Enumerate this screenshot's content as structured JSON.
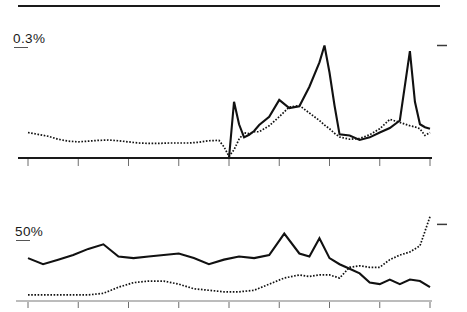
{
  "figure": {
    "title": "",
    "top_rule": true
  },
  "panels": [
    {
      "id": "top",
      "level_label": "0.3%",
      "right_marker": "dash",
      "axis": {
        "x_min": 1905,
        "x_max": 1985,
        "tick_years": [
          1905,
          1915,
          1925,
          1935,
          1945,
          1955,
          1965,
          1975,
          1985
        ],
        "tick_labels": [
          "1905",
          "",
          "1925",
          "",
          "1945",
          "",
          "1965",
          "",
          "1985"
        ],
        "y_min": 0,
        "y_max": 0.36,
        "y_reference": 0.3
      }
    },
    {
      "id": "bottom",
      "level_label": "50%",
      "right_marker": "dash",
      "axis": {
        "x_min": 1905,
        "x_max": 1985,
        "tick_years": [
          1905,
          1915,
          1925,
          1935,
          1945,
          1955,
          1965,
          1975,
          1985
        ],
        "tick_labels": [
          "",
          "",
          "",
          "",
          "",
          "",
          "",
          "",
          ""
        ],
        "y_min": 0,
        "y_max": 62,
        "y_reference": 50
      }
    }
  ],
  "chart_data": [
    {
      "type": "line",
      "title": "",
      "subtitle": "",
      "xlabel": "",
      "ylabel": "",
      "panel": "top",
      "xlim": [
        1905,
        1985
      ],
      "ylim": [
        0,
        0.36
      ],
      "grid": false,
      "legend": "none",
      "annotations": [
        {
          "text": "0.3%",
          "role": "y-reference-level",
          "value": 0.3
        },
        {
          "text": "1905",
          "role": "x-tick"
        },
        {
          "text": "1925",
          "role": "x-tick"
        },
        {
          "text": "1945",
          "role": "x-tick"
        },
        {
          "text": "1965",
          "role": "x-tick"
        },
        {
          "text": "1985",
          "role": "x-tick"
        }
      ],
      "x": [
        1905,
        1907,
        1909,
        1911,
        1913,
        1915,
        1917,
        1919,
        1921,
        1923,
        1925,
        1927,
        1929,
        1931,
        1933,
        1935,
        1937,
        1939,
        1941,
        1943,
        1944,
        1945,
        1946,
        1947,
        1948,
        1949,
        1950,
        1951,
        1953,
        1955,
        1957,
        1959,
        1961,
        1963,
        1964,
        1965,
        1966,
        1967,
        1969,
        1971,
        1973,
        1975,
        1977,
        1979,
        1981,
        1982,
        1983,
        1984,
        1985
      ],
      "series": [
        {
          "name": "solid-series",
          "style": "solid",
          "values": [
            null,
            null,
            null,
            null,
            null,
            null,
            null,
            null,
            null,
            null,
            null,
            null,
            null,
            null,
            null,
            null,
            null,
            null,
            null,
            null,
            0.0,
            0.0,
            0.15,
            0.09,
            0.055,
            0.062,
            0.072,
            0.088,
            0.11,
            0.155,
            0.133,
            0.138,
            0.19,
            0.255,
            0.3,
            0.228,
            0.14,
            0.063,
            0.06,
            0.048,
            0.055,
            0.068,
            0.08,
            0.1,
            0.285,
            0.15,
            0.09,
            0.082,
            0.078
          ]
        },
        {
          "name": "dotted-series",
          "style": "dotted",
          "values": [
            0.068,
            0.063,
            0.058,
            0.05,
            0.045,
            0.043,
            0.045,
            0.047,
            0.048,
            0.046,
            0.043,
            0.04,
            0.039,
            0.039,
            0.04,
            0.04,
            0.04,
            0.042,
            0.046,
            0.047,
            0.03,
            0.004,
            0.022,
            0.05,
            0.067,
            0.065,
            0.07,
            0.07,
            0.086,
            0.11,
            0.136,
            0.14,
            0.12,
            0.1,
            0.088,
            0.078,
            0.066,
            0.056,
            0.05,
            0.052,
            0.062,
            0.078,
            0.103,
            0.095,
            0.086,
            0.083,
            0.078,
            0.06,
            0.068
          ]
        }
      ]
    },
    {
      "type": "line",
      "title": "",
      "subtitle": "",
      "xlabel": "",
      "ylabel": "",
      "panel": "bottom",
      "xlim": [
        1905,
        1985
      ],
      "ylim": [
        0,
        62
      ],
      "grid": false,
      "legend": "none",
      "annotations": [
        {
          "text": "50%",
          "role": "y-reference-level",
          "value": 50
        }
      ],
      "x": [
        1905,
        1908,
        1911,
        1914,
        1917,
        1920,
        1923,
        1926,
        1929,
        1932,
        1935,
        1938,
        1941,
        1944,
        1947,
        1950,
        1953,
        1956,
        1959,
        1961,
        1963,
        1965,
        1967,
        1969,
        1971,
        1973,
        1975,
        1977,
        1979,
        1981,
        1983,
        1985
      ],
      "series": [
        {
          "name": "solid-series",
          "style": "solid",
          "values": [
            28,
            24,
            27,
            30,
            34,
            37,
            29,
            28,
            29,
            30,
            31,
            28,
            24,
            27,
            29,
            28,
            30,
            44,
            31,
            29,
            41,
            28,
            24,
            21,
            18,
            12,
            11,
            14,
            11,
            14,
            13,
            9
          ]
        },
        {
          "name": "dotted-series",
          "style": "dotted",
          "values": [
            4,
            4,
            4,
            4,
            4,
            5,
            9,
            12,
            13,
            13,
            11,
            8,
            7,
            6,
            6,
            7,
            11,
            15,
            17,
            16,
            17,
            17,
            15,
            22,
            23,
            22,
            22,
            27,
            30,
            32,
            36,
            55
          ]
        }
      ]
    }
  ]
}
